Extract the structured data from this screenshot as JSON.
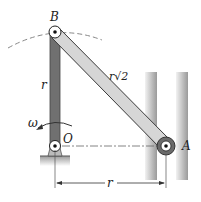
{
  "diagram": {
    "type": "mechanism",
    "points": {
      "B": {
        "label": "B",
        "x": 55,
        "y": 32
      },
      "O": {
        "label": "O",
        "x": 55,
        "y": 146
      },
      "A": {
        "label": "A",
        "x": 166,
        "y": 146
      }
    },
    "links": [
      {
        "from": "O",
        "to": "B",
        "label": "r"
      },
      {
        "from": "B",
        "to": "A",
        "label": "r√2"
      }
    ],
    "angular_velocity": {
      "symbol": "ω",
      "at": "O"
    },
    "dimension": {
      "label": "r",
      "from": "O",
      "to": "A"
    },
    "colors": {
      "link_dark": "#6e6e6e",
      "link_light": "#d4d4d4",
      "outline": "#3a3a3a",
      "rail": "#bdbdbd",
      "dashed": "#888888"
    }
  }
}
